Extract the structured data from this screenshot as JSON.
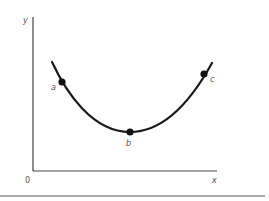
{
  "diagram": {
    "type": "u-shaped-curve",
    "axes": {
      "y_label": "y",
      "x_label": "x",
      "origin_label": "0"
    },
    "points": [
      {
        "id": "a",
        "label": "a"
      },
      {
        "id": "b",
        "label": "b"
      },
      {
        "id": "c",
        "label": "c"
      }
    ],
    "colors": {
      "axis": "#444444",
      "curve": "#1a1a1a",
      "point": "#111111",
      "label": "#555555",
      "rule": "#aaaaaa"
    }
  }
}
